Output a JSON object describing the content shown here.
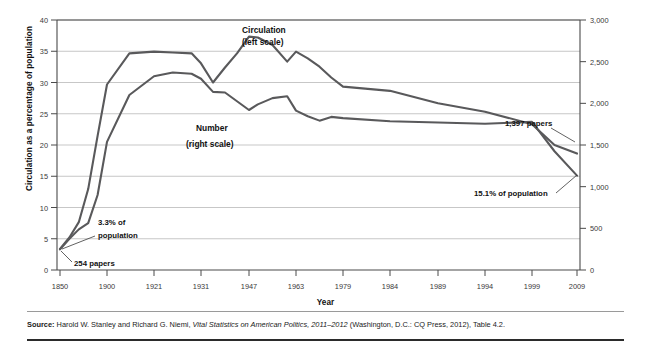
{
  "figure": {
    "x_axis_title": "Year",
    "y_axis_left_title": "Circulation as a percentage of population",
    "y_axis_right_title": "Number of daily newspapers",
    "source_label": "Source:",
    "source_text_a": " Harold W. Stanley and Richard G. Niemi, ",
    "source_text_italic": "Vital Statistics on American Politics, 2011–2012",
    "source_text_b": " (Washington, D.C.: CQ Press, 2012), Table 4.2."
  },
  "annotations": {
    "circulation_legend_line1": "Circulation",
    "circulation_legend_line2": "(left scale)",
    "number_legend_line1": "Number",
    "number_legend_line2": "(right scale)",
    "start_pct": "3.3% of",
    "start_pct_line2": "population",
    "start_papers": "254 papers",
    "end_papers": "1,397 papers",
    "end_pct": "15.1% of population"
  },
  "colors": {
    "line": "#59595b",
    "grid": "#b9b9b9",
    "axis": "#4a4a4a",
    "text": "#1a1a1a",
    "background": "#ffffff"
  },
  "chart_data": {
    "type": "line",
    "title": "",
    "xlabel": "Year",
    "ylabel": "Circulation as a percentage of population",
    "y2label": "Number of daily newspapers",
    "grid": true,
    "legend": "inline-annotations",
    "x_tick_labels": [
      "1850",
      "1900",
      "1921",
      "1931",
      "1947",
      "1963",
      "1979",
      "1984",
      "1989",
      "1994",
      "1999",
      "2009"
    ],
    "ylim_left": [
      0,
      40
    ],
    "y_tick_labels_left": [
      "0",
      "5",
      "10",
      "15",
      "20",
      "25",
      "30",
      "35",
      "40"
    ],
    "ylim_right": [
      0,
      3000
    ],
    "y_tick_labels_right": [
      "0",
      "500",
      "1,000",
      "1,500",
      "2,000",
      "2,500",
      "3,000"
    ],
    "series": [
      {
        "name": "Circulation (left scale)",
        "axis": "left",
        "units": "percent of population",
        "x": [
          1850,
          1860,
          1870,
          1880,
          1890,
          1900,
          1910,
          1921,
          1925,
          1929,
          1931,
          1935,
          1939,
          1943,
          1947,
          1950,
          1955,
          1960,
          1963,
          1967,
          1971,
          1975,
          1979,
          1984,
          1989,
          1994,
          1999,
          2004,
          2009
        ],
        "values": [
          3.3,
          5.0,
          6.5,
          7.5,
          12.0,
          20.5,
          28.0,
          31.0,
          31.6,
          31.4,
          30.6,
          28.5,
          28.4,
          27.0,
          25.6,
          26.5,
          27.5,
          27.8,
          25.5,
          24.6,
          23.9,
          24.5,
          24.3,
          23.8,
          23.6,
          23.4,
          23.7,
          19.0,
          15.1
        ]
      },
      {
        "name": "Number of daily newspapers (right scale)",
        "axis": "right",
        "units": "papers",
        "x": [
          1850,
          1860,
          1870,
          1880,
          1890,
          1900,
          1910,
          1921,
          1925,
          1929,
          1931,
          1935,
          1939,
          1943,
          1947,
          1950,
          1955,
          1960,
          1963,
          1967,
          1971,
          1975,
          1979,
          1984,
          1989,
          1994,
          1999,
          2004,
          2009
        ],
        "values": [
          254,
          390,
          574,
          971,
          1610,
          2226,
          2600,
          2620,
          2610,
          2600,
          2480,
          2250,
          2430,
          2600,
          2800,
          2790,
          2700,
          2500,
          2620,
          2540,
          2440,
          2310,
          2200,
          2150,
          2000,
          1900,
          1750,
          1500,
          1397
        ]
      }
    ],
    "callouts": [
      {
        "label": "3.3% of population",
        "x": 1850,
        "series": "Circulation"
      },
      {
        "label": "254 papers",
        "x": 1850,
        "series": "Number"
      },
      {
        "label": "1,397 papers",
        "x": 2009,
        "series": "Number"
      },
      {
        "label": "15.1% of population",
        "x": 2009,
        "series": "Circulation"
      }
    ]
  }
}
